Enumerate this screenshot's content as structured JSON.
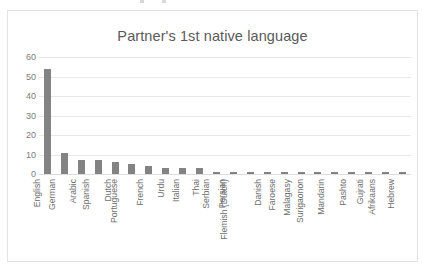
{
  "chart_data": {
    "type": "bar",
    "title": "Partner's 1st native language",
    "xlabel": "",
    "ylabel": "",
    "ylim": [
      0,
      60
    ],
    "yticks": [
      0,
      10,
      20,
      30,
      40,
      50,
      60
    ],
    "grid": true,
    "legend": false,
    "orientation": "vertical",
    "bar_color": "#838383",
    "categories": [
      "English",
      "German",
      "Arabic",
      "Spanish",
      "Dutch",
      "Portuguese",
      "French",
      "Urdu",
      "Italian",
      "Thai",
      "Serbian",
      "Persian",
      "Flemish (Dutch)",
      "Danish",
      "Faroese",
      "Malagasy",
      "Surigaonon",
      "Mandarin",
      "Pashto",
      "Gujrati",
      "Afrikaans",
      "Hebrew"
    ],
    "values": [
      54,
      11,
      7,
      7,
      6,
      5,
      4,
      3,
      3,
      3,
      1,
      1,
      1,
      1,
      1,
      1,
      1,
      1,
      1,
      1,
      1,
      1
    ]
  },
  "axis": {
    "y_tick_labels": [
      "60",
      "50",
      "40",
      "30",
      "20",
      "10",
      "0"
    ]
  },
  "colors": {
    "bar": "#838383",
    "title_text": "#5a5a5a",
    "tick_text": "#7b7b7b",
    "gridline": "#e8e8e8",
    "frame_border": "#e2e2e2",
    "background": "#ffffff"
  }
}
